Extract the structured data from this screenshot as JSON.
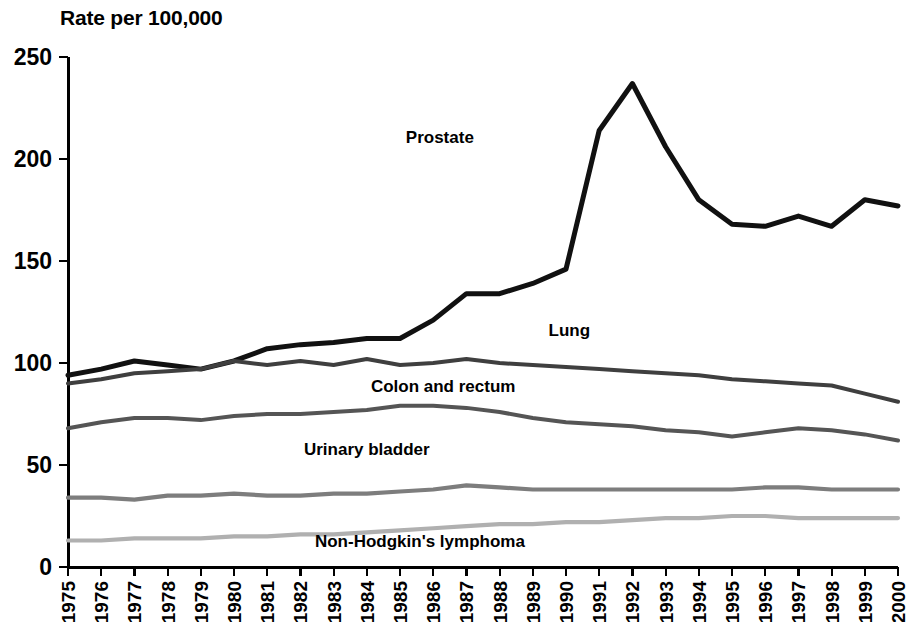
{
  "chart_data": {
    "type": "line",
    "title": "Rate per 100,000",
    "xlabel": "",
    "ylabel": "Rate per 100,000",
    "ylim": [
      0,
      250
    ],
    "yticks": [
      0,
      50,
      100,
      150,
      200,
      250
    ],
    "grid": false,
    "legend_position": "inline-labels",
    "x": [
      1975,
      1976,
      1977,
      1978,
      1979,
      1980,
      1981,
      1982,
      1983,
      1984,
      1985,
      1986,
      1987,
      1988,
      1989,
      1990,
      1991,
      1992,
      1993,
      1994,
      1995,
      1996,
      1997,
      1998,
      1999,
      2000
    ],
    "categories": [
      "1975",
      "1976",
      "1977",
      "1978",
      "1979",
      "1980",
      "1981",
      "1982",
      "1983",
      "1984",
      "1985",
      "1986",
      "1987",
      "1988",
      "1989",
      "1990",
      "1991",
      "1992",
      "1993",
      "1994",
      "1995",
      "1996",
      "1997",
      "1998",
      "1999",
      "2000"
    ],
    "series": [
      {
        "name": "Prostate",
        "color": "#111111",
        "label_x": 1986.2,
        "label_y": 208,
        "values": [
          94,
          97,
          101,
          99,
          97,
          101,
          107,
          109,
          110,
          112,
          112,
          121,
          134,
          134,
          139,
          146,
          214,
          237,
          206,
          180,
          168,
          167,
          172,
          167,
          180,
          177
        ]
      },
      {
        "name": "Lung",
        "color": "#3f3f3f",
        "label_x": 1990.1,
        "label_y": 113,
        "values": [
          90,
          92,
          95,
          96,
          97,
          101,
          99,
          101,
          99,
          102,
          99,
          100,
          102,
          100,
          99,
          98,
          97,
          96,
          95,
          94,
          92,
          91,
          90,
          89,
          85,
          81
        ]
      },
      {
        "name": "Colon and rectum",
        "color": "#555555",
        "label_x": 1986.3,
        "label_y": 86,
        "values": [
          68,
          71,
          73,
          73,
          72,
          74,
          75,
          75,
          76,
          77,
          79,
          79,
          78,
          76,
          73,
          71,
          70,
          69,
          67,
          66,
          64,
          66,
          68,
          67,
          65,
          62
        ]
      },
      {
        "name": "Urinary bladder",
        "color": "#7d7d7d",
        "label_x": 1984.0,
        "label_y": 55,
        "values": [
          34,
          34,
          33,
          35,
          35,
          36,
          35,
          35,
          36,
          36,
          37,
          38,
          40,
          39,
          38,
          38,
          38,
          38,
          38,
          38,
          38,
          39,
          39,
          38,
          38,
          38
        ]
      },
      {
        "name": "Non-Hodgkin's lymphoma",
        "color": "#b0b0b0",
        "label_x": 1985.6,
        "label_y": 10,
        "values": [
          13,
          13,
          14,
          14,
          14,
          15,
          15,
          16,
          16,
          17,
          18,
          19,
          20,
          21,
          21,
          22,
          22,
          23,
          24,
          24,
          25,
          25,
          24,
          24,
          24,
          24
        ]
      }
    ]
  }
}
